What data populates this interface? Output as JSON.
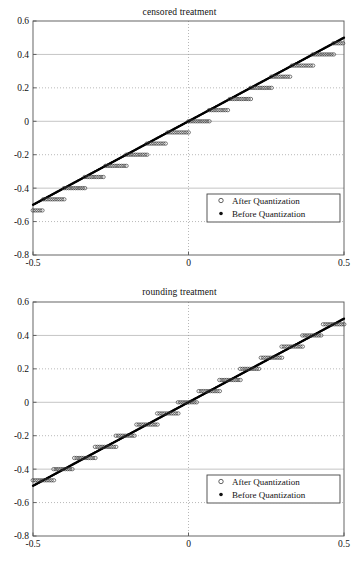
{
  "page": {
    "width": 359,
    "height": 561,
    "background": "#ffffff"
  },
  "charts": [
    {
      "id": "censored",
      "title": "censored treatment",
      "legend": {
        "position": "lower-right",
        "entries": [
          {
            "label": "After Quantization",
            "marker": "open-circle"
          },
          {
            "label": "Before Quantization",
            "marker": "filled-dot"
          }
        ]
      }
    },
    {
      "id": "rounding",
      "title": "rounding treatment",
      "legend": {
        "position": "lower-right",
        "entries": [
          {
            "label": "After Quantization",
            "marker": "open-circle"
          },
          {
            "label": "Before Quantization",
            "marker": "filled-dot"
          }
        ]
      }
    }
  ],
  "chart_data": [
    {
      "type": "scatter",
      "id": "censored",
      "title": "censored treatment",
      "xlabel": "",
      "ylabel": "",
      "xlim": [
        -0.5,
        0.5
      ],
      "ylim": [
        -0.8,
        0.6
      ],
      "xticks": [
        -0.5,
        0,
        0.5
      ],
      "xtick_labels": [
        "-0.5",
        "0",
        "0.5"
      ],
      "yticks": [
        -0.8,
        -0.6,
        -0.4,
        -0.2,
        0,
        0.2,
        0.4,
        0.6
      ],
      "ytick_labels": [
        "-0.8",
        "-0.6",
        "-0.4",
        "-0.2",
        "0",
        "0.2",
        "0.4",
        "0.6"
      ],
      "grid": true,
      "grid_style": "dotted",
      "legend_position": "lower right",
      "quantization_step": 0.0667,
      "series": [
        {
          "name": "Before Quantization",
          "marker": "filled-dot",
          "description": "dense identity line y = x from -0.5 to 0.5",
          "x": [
            -0.5,
            -0.4,
            -0.3,
            -0.2,
            -0.1,
            0,
            0.1,
            0.2,
            0.3,
            0.4,
            0.5
          ],
          "y": [
            -0.5,
            -0.4,
            -0.3,
            -0.2,
            -0.1,
            0,
            0.1,
            0.2,
            0.3,
            0.4,
            0.5
          ]
        },
        {
          "name": "After Quantization",
          "marker": "open-circle",
          "description": "floor (censored/truncation) quantizer: staircase lying at or below y=x, each tread starting on the line and extending rightward",
          "levels": [
            -0.5333,
            -0.4667,
            -0.4,
            -0.3333,
            -0.2667,
            -0.2,
            -0.1333,
            -0.0667,
            0,
            0.0667,
            0.1333,
            0.2,
            0.2667,
            0.3333,
            0.4,
            0.4667
          ],
          "tread_starts": [
            -0.5,
            -0.4667,
            -0.4,
            -0.3333,
            -0.2667,
            -0.2,
            -0.1333,
            -0.0667,
            0,
            0.0667,
            0.1333,
            0.2,
            0.2667,
            0.3333,
            0.4,
            0.4667
          ],
          "tread_ends": [
            -0.4667,
            -0.4,
            -0.3333,
            -0.2667,
            -0.2,
            -0.1333,
            -0.0667,
            0,
            0.0667,
            0.1333,
            0.2,
            0.2667,
            0.3333,
            0.4,
            0.4667,
            0.5
          ]
        }
      ]
    },
    {
      "type": "scatter",
      "id": "rounding",
      "title": "rounding treatment",
      "xlabel": "",
      "ylabel": "",
      "xlim": [
        -0.5,
        0.5
      ],
      "ylim": [
        -0.8,
        0.6
      ],
      "xticks": [
        -0.5,
        0,
        0.5
      ],
      "xtick_labels": [
        "-0.5",
        "0",
        "0.5"
      ],
      "yticks": [
        -0.8,
        -0.6,
        -0.4,
        -0.2,
        0,
        0.2,
        0.4,
        0.6
      ],
      "ytick_labels": [
        "-0.8",
        "-0.6",
        "-0.4",
        "-0.2",
        "0",
        "0.2",
        "0.4",
        "0.6"
      ],
      "grid": true,
      "grid_style": "dotted",
      "legend_position": "lower right",
      "quantization_step": 0.0667,
      "series": [
        {
          "name": "Before Quantization",
          "marker": "filled-dot",
          "description": "dense identity line y = x from -0.5 to 0.5",
          "x": [
            -0.5,
            -0.4,
            -0.3,
            -0.2,
            -0.1,
            0,
            0.1,
            0.2,
            0.3,
            0.4,
            0.5
          ],
          "y": [
            -0.5,
            -0.4,
            -0.3,
            -0.2,
            -0.1,
            0,
            0.1,
            0.2,
            0.3,
            0.4,
            0.5
          ]
        },
        {
          "name": "After Quantization",
          "marker": "open-circle",
          "description": "round-to-nearest quantizer: short staircase treads centred on y=x, straddling the line symmetrically",
          "levels": [
            -0.4667,
            -0.4,
            -0.3333,
            -0.2667,
            -0.2,
            -0.1333,
            -0.0667,
            0,
            0.0667,
            0.1333,
            0.2,
            0.2667,
            0.3333,
            0.4,
            0.4667,
            0.5333
          ],
          "tread_starts": [
            -0.5,
            -0.4333,
            -0.3667,
            -0.3,
            -0.2333,
            -0.1667,
            -0.1,
            -0.0333,
            0.0333,
            0.1,
            0.1667,
            0.2333,
            0.3,
            0.3667,
            0.4333,
            0.5
          ],
          "tread_ends": [
            -0.4333,
            -0.3667,
            -0.3,
            -0.2333,
            -0.1667,
            -0.1,
            -0.0333,
            0.0333,
            0.1,
            0.1667,
            0.2333,
            0.3,
            0.3667,
            0.4333,
            0.5,
            0.5
          ]
        }
      ]
    }
  ]
}
